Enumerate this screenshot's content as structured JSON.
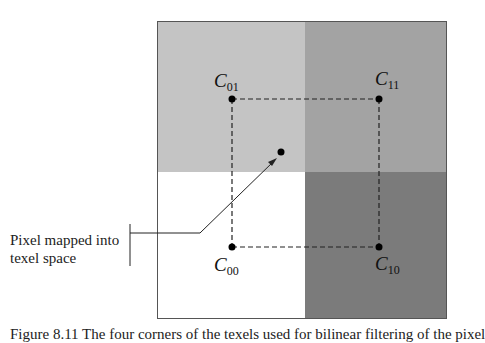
{
  "figure": {
    "quadrants": {
      "top_left": {
        "color": "#c4c4c4"
      },
      "top_right": {
        "color": "#a4a4a4"
      },
      "bottom_left": {
        "color": "#ffffff"
      },
      "bottom_right": {
        "color": "#7c7c7c"
      }
    },
    "corners": {
      "c01": {
        "main": "C",
        "sub": "01"
      },
      "c11": {
        "main": "C",
        "sub": "11"
      },
      "c00": {
        "main": "C",
        "sub": "00"
      },
      "c10": {
        "main": "C",
        "sub": "10"
      }
    },
    "callout_line1": "Pixel mapped into",
    "callout_line2": "texel space"
  },
  "caption": "Figure 8.11  The four corners of the texels used for bilinear filtering of the pixel"
}
